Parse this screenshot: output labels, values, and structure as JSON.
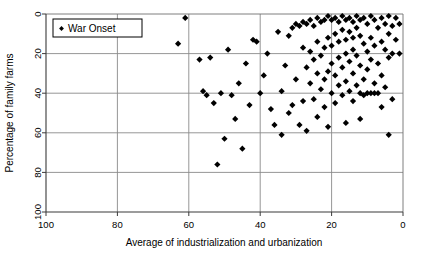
{
  "chart_data": {
    "type": "scatter",
    "title": "",
    "xlabel": "Average of industrialization and urbanization",
    "ylabel": "Percentage of family farms",
    "xlim": [
      100,
      0
    ],
    "ylim": [
      100,
      0
    ],
    "x_reversed": true,
    "y_reversed": true,
    "xticks": [
      100,
      80,
      60,
      40,
      20,
      0
    ],
    "yticks": [
      0,
      20,
      40,
      60,
      80,
      100
    ],
    "xtick_labels": [
      "100",
      "80",
      "60",
      "40",
      "20",
      "0"
    ],
    "ytick_labels": [
      "0",
      "20",
      "40",
      "60",
      "80",
      "100"
    ],
    "grid": true,
    "grid_axis": "both",
    "legend": {
      "position": "top-left-inside",
      "entries": [
        {
          "name": "War Onset",
          "marker": "diamond",
          "color": "#000000"
        }
      ]
    },
    "series": [
      {
        "name": "War Onset",
        "marker": "diamond",
        "color": "#000000",
        "points": [
          [
            63,
            15
          ],
          [
            61,
            2
          ],
          [
            57,
            23
          ],
          [
            56,
            39
          ],
          [
            55,
            41
          ],
          [
            54,
            22
          ],
          [
            53,
            45
          ],
          [
            52,
            76
          ],
          [
            51,
            40
          ],
          [
            50,
            63
          ],
          [
            49,
            18
          ],
          [
            48,
            41
          ],
          [
            47,
            53
          ],
          [
            46,
            35
          ],
          [
            45,
            68
          ],
          [
            44,
            25
          ],
          [
            43,
            46
          ],
          [
            42,
            13
          ],
          [
            41,
            14
          ],
          [
            40,
            40
          ],
          [
            39,
            31
          ],
          [
            38,
            20
          ],
          [
            37,
            48
          ],
          [
            36,
            56
          ],
          [
            35,
            9
          ],
          [
            34,
            39
          ],
          [
            34,
            61
          ],
          [
            33,
            26
          ],
          [
            32,
            11
          ],
          [
            32,
            50
          ],
          [
            31,
            7
          ],
          [
            31,
            46
          ],
          [
            30,
            5
          ],
          [
            30,
            33
          ],
          [
            29,
            6
          ],
          [
            29,
            56
          ],
          [
            28,
            4
          ],
          [
            28,
            17
          ],
          [
            28,
            44
          ],
          [
            27,
            5
          ],
          [
            27,
            27
          ],
          [
            27,
            59
          ],
          [
            26,
            3
          ],
          [
            26,
            19
          ],
          [
            26,
            35
          ],
          [
            25,
            6
          ],
          [
            25,
            23
          ],
          [
            25,
            43
          ],
          [
            24,
            2
          ],
          [
            24,
            14
          ],
          [
            24,
            30
          ],
          [
            24,
            52
          ],
          [
            23,
            4
          ],
          [
            23,
            21
          ],
          [
            23,
            38
          ],
          [
            22,
            3
          ],
          [
            22,
            17
          ],
          [
            22,
            33
          ],
          [
            22,
            47
          ],
          [
            21,
            1
          ],
          [
            21,
            12
          ],
          [
            21,
            29
          ],
          [
            21,
            57
          ],
          [
            20,
            3
          ],
          [
            20,
            16
          ],
          [
            20,
            25
          ],
          [
            20,
            40
          ],
          [
            19,
            2
          ],
          [
            19,
            10
          ],
          [
            19,
            31
          ],
          [
            19,
            45
          ],
          [
            18,
            4
          ],
          [
            18,
            14
          ],
          [
            18,
            22
          ],
          [
            18,
            36
          ],
          [
            17,
            1
          ],
          [
            17,
            8
          ],
          [
            17,
            27
          ],
          [
            17,
            41
          ],
          [
            16,
            3
          ],
          [
            16,
            13
          ],
          [
            16,
            20
          ],
          [
            16,
            34
          ],
          [
            16,
            55
          ],
          [
            15,
            2
          ],
          [
            15,
            9
          ],
          [
            15,
            24
          ],
          [
            15,
            39
          ],
          [
            14,
            4
          ],
          [
            14,
            12
          ],
          [
            14,
            18
          ],
          [
            14,
            30
          ],
          [
            14,
            44
          ],
          [
            13,
            1
          ],
          [
            13,
            7
          ],
          [
            13,
            21
          ],
          [
            13,
            36
          ],
          [
            12,
            3
          ],
          [
            12,
            11
          ],
          [
            12,
            26
          ],
          [
            12,
            40
          ],
          [
            12,
            53
          ],
          [
            11,
            2
          ],
          [
            11,
            15
          ],
          [
            11,
            33
          ],
          [
            11,
            41
          ],
          [
            10,
            5
          ],
          [
            10,
            19
          ],
          [
            10,
            28
          ],
          [
            10,
            40
          ],
          [
            9,
            1
          ],
          [
            9,
            12
          ],
          [
            9,
            23
          ],
          [
            9,
            40
          ],
          [
            8,
            3
          ],
          [
            8,
            16
          ],
          [
            8,
            35
          ],
          [
            8,
            40
          ],
          [
            7,
            7
          ],
          [
            7,
            25
          ],
          [
            7,
            40
          ],
          [
            6,
            2
          ],
          [
            6,
            14
          ],
          [
            6,
            31
          ],
          [
            6,
            47
          ],
          [
            5,
            5
          ],
          [
            5,
            18
          ],
          [
            5,
            37
          ],
          [
            4,
            1
          ],
          [
            4,
            10
          ],
          [
            4,
            22
          ],
          [
            4,
            61
          ],
          [
            3,
            6
          ],
          [
            3,
            20
          ],
          [
            3,
            43
          ],
          [
            2,
            2
          ],
          [
            2,
            13
          ],
          [
            1,
            5
          ],
          [
            1,
            20
          ]
        ]
      }
    ]
  }
}
